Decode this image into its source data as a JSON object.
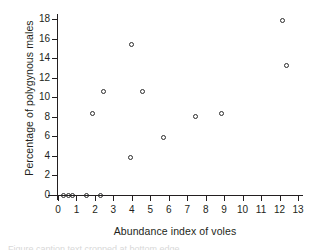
{
  "chart_data": {
    "type": "scatter",
    "title": "",
    "xlabel": "Abundance index of voles",
    "ylabel": "Percentage of polygynous males",
    "xlim": [
      0,
      13
    ],
    "ylim": [
      0,
      18
    ],
    "xticks": [
      "0",
      "1",
      "2",
      "3",
      "4",
      "5",
      "6",
      "7",
      "8",
      "9",
      "10",
      "11",
      "12",
      "13"
    ],
    "yticks": [
      "0",
      "2",
      "4",
      "6",
      "8",
      "10",
      "12",
      "14",
      "16",
      "18"
    ],
    "grid": false,
    "legend": false,
    "marker": "open-circle",
    "marker_color": "#2b2b2b",
    "points": [
      {
        "x": 0.3,
        "y": 0.0
      },
      {
        "x": 0.55,
        "y": 0.0
      },
      {
        "x": 0.78,
        "y": 0.0
      },
      {
        "x": 1.55,
        "y": 0.0
      },
      {
        "x": 2.3,
        "y": 0.0
      },
      {
        "x": 1.85,
        "y": 8.35
      },
      {
        "x": 2.45,
        "y": 10.6
      },
      {
        "x": 3.9,
        "y": 3.85
      },
      {
        "x": 4.0,
        "y": 15.4
      },
      {
        "x": 4.6,
        "y": 10.55
      },
      {
        "x": 5.7,
        "y": 5.85
      },
      {
        "x": 7.45,
        "y": 8.05
      },
      {
        "x": 8.85,
        "y": 8.35
      },
      {
        "x": 12.15,
        "y": 17.85
      },
      {
        "x": 12.4,
        "y": 13.2
      }
    ]
  },
  "figure": {
    "background_color": "#ffffff",
    "axis_color": "#231f20",
    "caption_sliver": "Figure caption text cropped at bottom edge"
  }
}
